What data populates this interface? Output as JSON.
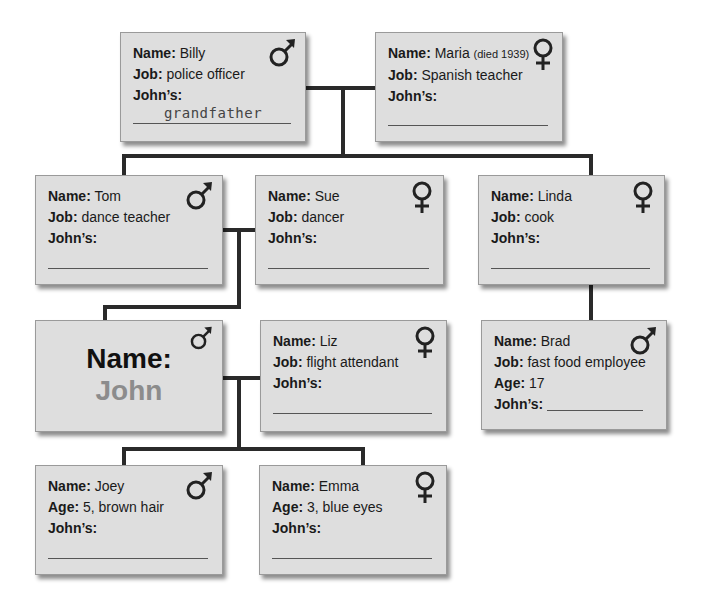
{
  "labels": {
    "name": "Name:",
    "job": "Job:",
    "age": "Age:",
    "johns": "John’s:"
  },
  "cards": {
    "billy": {
      "name": "Billy",
      "job": "police officer",
      "johns": "grandfather",
      "sex": "male"
    },
    "maria": {
      "name": "Maria",
      "note": "(died 1939)",
      "job": "Spanish teacher",
      "johns": "",
      "sex": "female"
    },
    "tom": {
      "name": "Tom",
      "job": "dance teacher",
      "johns": "",
      "sex": "male"
    },
    "sue": {
      "name": "Sue",
      "job": "dancer",
      "johns": "",
      "sex": "female"
    },
    "linda": {
      "name": "Linda",
      "job": "cook",
      "johns": "",
      "sex": "female"
    },
    "john": {
      "label": "Name:",
      "name": "John",
      "sex": "male"
    },
    "liz": {
      "name": "Liz",
      "job": "flight attendant",
      "johns": "",
      "sex": "female"
    },
    "brad": {
      "name": "Brad",
      "job": "fast food employee",
      "age": "17",
      "johns": "",
      "sex": "male"
    },
    "joey": {
      "name": "Joey",
      "age": "5, brown hair",
      "johns": "",
      "sex": "male"
    },
    "emma": {
      "name": "Emma",
      "age": "3, blue eyes",
      "johns": "",
      "sex": "female"
    }
  },
  "colors": {
    "card_bg": "#dedede",
    "connector": "#2a2a2a",
    "john_name": "#8c8c8c"
  }
}
